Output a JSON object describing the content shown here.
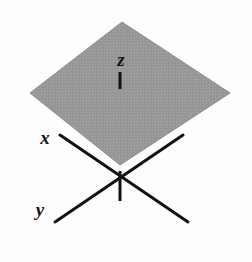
{
  "figure": {
    "background_color": "#fdfdfd",
    "width": 252,
    "height": 262
  },
  "plane": {
    "name": "xy-plane",
    "shape": "rhombus",
    "fill_color": "#969696",
    "edge_color": "#8d8d8d",
    "vertices": [
      {
        "label": "top",
        "x": 122,
        "y": 22
      },
      {
        "label": "right",
        "x": 230,
        "y": 93
      },
      {
        "label": "bottom",
        "x": 120,
        "y": 165
      },
      {
        "label": "left",
        "x": 30,
        "y": 93
      }
    ],
    "points_attr": "122,22 230,93 120,165 30,93"
  },
  "origin": {
    "x": 120,
    "y": 177
  },
  "axes": {
    "line_color": "#121212",
    "line_width": 3,
    "items": [
      {
        "id": "x",
        "label": "x",
        "label_x": 45,
        "label_y": 140,
        "x1": 60,
        "y1": 135,
        "x2": 188,
        "y2": 222
      },
      {
        "id": "y",
        "label": "y",
        "label_x": 40,
        "label_y": 212,
        "x1": 183,
        "y1": 135,
        "x2": 55,
        "y2": 222
      }
    ]
  },
  "z_axis": {
    "id": "z",
    "label": "z",
    "label_x": 121,
    "label_y": 62,
    "tick_x1": 120,
    "tick_y1": 72,
    "tick_x2": 120,
    "tick_y2": 89,
    "stem_x1": 120,
    "stem_y1": 171,
    "stem_x2": 120,
    "stem_y2": 201,
    "line_color": "#121212",
    "line_width": 3
  }
}
